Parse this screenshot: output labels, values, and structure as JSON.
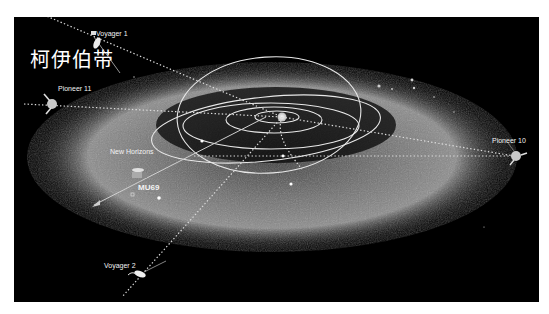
{
  "title": "柯伊伯带",
  "colors": {
    "background": "#000000",
    "belt": "#9a9a9a",
    "orbit": "#e8e8e8",
    "trajectory": "#d8d8d8",
    "border": "#ffffff"
  },
  "labels": {
    "voyager1": "Voyager 1",
    "voyager2": "Voyager 2",
    "pioneer11": "Pioneer 11",
    "pioneer10": "Pioneer 10",
    "new_horizons": "New Horizons",
    "mu69": "MU69"
  },
  "icons": {
    "sun": "sun-icon",
    "spacecraft": "spacecraft-icon"
  }
}
